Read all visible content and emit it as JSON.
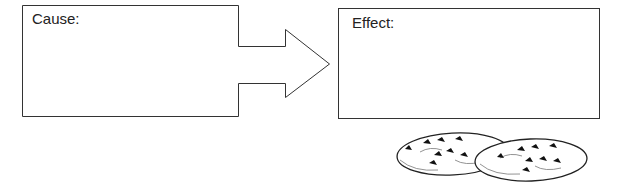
{
  "cause_box": {
    "label": "Cause:"
  },
  "effect_box": {
    "label": "Effect:"
  },
  "arrow": {
    "direction": "right"
  },
  "illustration": {
    "subject": "chocolate-chip-cookies",
    "count": 2
  },
  "colors": {
    "stroke": "#333333",
    "background": "#ffffff",
    "chip": "#111111"
  }
}
